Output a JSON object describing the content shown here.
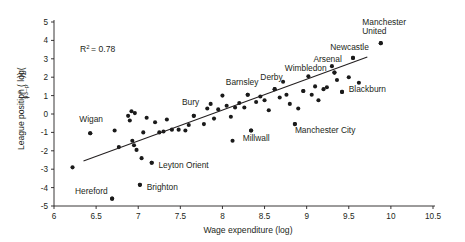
{
  "chart_data": {
    "type": "scatter",
    "title": "",
    "xlabel": "Wage expenditure (log)",
    "ylabel": "League position ( log(p/(93-p)) )",
    "ylabel_parts": {
      "prefix": "League position ( log(",
      "numerator": "p",
      "denominator": "93–p",
      "suffix": "))"
    },
    "annotation": "R² = 0.78",
    "annotation_parts": {
      "base": "R",
      "exponent": "2",
      "rest": "= 0.78"
    },
    "xlim": [
      6,
      10.5
    ],
    "ylim": [
      -5,
      5
    ],
    "xticks": [
      6,
      6.5,
      7,
      7.5,
      8,
      8.5,
      9,
      9.5,
      10,
      10.5
    ],
    "xticklabels": [
      "6",
      "6.5",
      "7",
      "7.5",
      "8",
      "8.5",
      "9",
      "9.5",
      "10",
      "10.5"
    ],
    "yticks": [
      -5,
      -4,
      -3,
      -2,
      -1,
      0,
      1,
      2,
      3,
      4,
      5
    ],
    "yticklabels": [
      "-5",
      "-4",
      "-3",
      "-2",
      "-1",
      "0",
      "1",
      "2",
      "3",
      "4",
      "5"
    ],
    "grid": false,
    "legend": null,
    "marker_color": "#1a1a1a",
    "line_color": "#231f20",
    "trendline": {
      "x0": 6.35,
      "y0": -2.55,
      "x1": 9.72,
      "y1": 3.1
    },
    "points": [
      {
        "x": 6.22,
        "y": -2.9
      },
      {
        "x": 6.43,
        "y": -1.05
      },
      {
        "x": 6.69,
        "y": -4.6
      },
      {
        "x": 6.72,
        "y": -0.9
      },
      {
        "x": 6.77,
        "y": -1.8
      },
      {
        "x": 6.88,
        "y": -0.1
      },
      {
        "x": 6.9,
        "y": -0.35
      },
      {
        "x": 6.92,
        "y": 0.15
      },
      {
        "x": 6.93,
        "y": -1.45
      },
      {
        "x": 6.95,
        "y": -1.7
      },
      {
        "x": 6.96,
        "y": 0.05
      },
      {
        "x": 6.98,
        "y": -1.95
      },
      {
        "x": 7.02,
        "y": -3.85
      },
      {
        "x": 7.04,
        "y": -2.4
      },
      {
        "x": 7.06,
        "y": -1.0
      },
      {
        "x": 7.1,
        "y": -0.2
      },
      {
        "x": 7.16,
        "y": -2.65
      },
      {
        "x": 7.2,
        "y": -0.45
      },
      {
        "x": 7.25,
        "y": -1.0
      },
      {
        "x": 7.3,
        "y": -0.95
      },
      {
        "x": 7.34,
        "y": -0.3
      },
      {
        "x": 7.4,
        "y": -0.85
      },
      {
        "x": 7.48,
        "y": -0.85
      },
      {
        "x": 7.56,
        "y": -0.9
      },
      {
        "x": 7.6,
        "y": -0.6
      },
      {
        "x": 7.66,
        "y": -0.1
      },
      {
        "x": 7.78,
        "y": -0.55
      },
      {
        "x": 7.82,
        "y": 0.3
      },
      {
        "x": 7.86,
        "y": 0.55
      },
      {
        "x": 7.9,
        "y": -0.25
      },
      {
        "x": 7.95,
        "y": 0.25
      },
      {
        "x": 8.0,
        "y": 1.0
      },
      {
        "x": 8.05,
        "y": 0.45
      },
      {
        "x": 8.1,
        "y": -0.15
      },
      {
        "x": 8.15,
        "y": 0.35
      },
      {
        "x": 8.2,
        "y": 0.6
      },
      {
        "x": 8.26,
        "y": 0.35
      },
      {
        "x": 8.3,
        "y": 1.05
      },
      {
        "x": 8.34,
        "y": -0.9
      },
      {
        "x": 8.4,
        "y": 0.65
      },
      {
        "x": 8.45,
        "y": 0.95
      },
      {
        "x": 8.5,
        "y": 0.75
      },
      {
        "x": 8.55,
        "y": 0.2
      },
      {
        "x": 8.62,
        "y": 1.35
      },
      {
        "x": 8.68,
        "y": 0.9
      },
      {
        "x": 8.72,
        "y": 1.75
      },
      {
        "x": 8.76,
        "y": 1.05
      },
      {
        "x": 8.8,
        "y": 0.55
      },
      {
        "x": 8.86,
        "y": -0.55
      },
      {
        "x": 8.9,
        "y": 0.3
      },
      {
        "x": 8.96,
        "y": 1.25
      },
      {
        "x": 9.02,
        "y": 2.05
      },
      {
        "x": 9.06,
        "y": 1.05
      },
      {
        "x": 9.1,
        "y": 1.5
      },
      {
        "x": 9.14,
        "y": 0.75
      },
      {
        "x": 9.2,
        "y": 1.35
      },
      {
        "x": 9.24,
        "y": 1.45
      },
      {
        "x": 9.3,
        "y": 2.6
      },
      {
        "x": 9.33,
        "y": 2.25
      },
      {
        "x": 9.36,
        "y": 1.85
      },
      {
        "x": 9.42,
        "y": 1.2
      },
      {
        "x": 9.5,
        "y": 2.0
      },
      {
        "x": 9.55,
        "y": 3.05
      },
      {
        "x": 9.62,
        "y": 1.7
      },
      {
        "x": 9.88,
        "y": 3.85
      },
      {
        "x": 8.12,
        "y": -1.45
      }
    ],
    "labelled_points": [
      {
        "name": "Hereford",
        "label": "Hereford",
        "x": 6.69,
        "y": -4.6,
        "label_x": 6.25,
        "label_y": -4.35,
        "anchor": "start"
      },
      {
        "name": "Wigan",
        "label": "Wigan",
        "x": 6.43,
        "y": -1.05,
        "label_x": 6.3,
        "label_y": -0.45,
        "anchor": "start"
      },
      {
        "name": "Brighton",
        "label": "Brighton",
        "x": 7.02,
        "y": -3.85,
        "label_x": 7.1,
        "label_y": -4.15,
        "anchor": "start"
      },
      {
        "name": "Leyton Orient",
        "label": "Leyton Orient",
        "x": 7.16,
        "y": -2.65,
        "label_x": 7.24,
        "label_y": -2.95,
        "anchor": "start"
      },
      {
        "name": "Bury",
        "label": "Bury",
        "x": 7.66,
        "y": -0.1,
        "label_x": 7.52,
        "label_y": 0.5,
        "anchor": "start"
      },
      {
        "name": "Barnsley",
        "label": "Barnsley",
        "x": 8.3,
        "y": 1.05,
        "label_x": 8.04,
        "label_y": 1.55,
        "anchor": "start"
      },
      {
        "name": "Derby",
        "label": "Derby",
        "x": 8.62,
        "y": 1.35,
        "label_x": 8.45,
        "label_y": 1.85,
        "anchor": "start"
      },
      {
        "name": "Millwall",
        "label": "Millwall",
        "x": 8.34,
        "y": -0.9,
        "label_x": 8.24,
        "label_y": -1.45,
        "anchor": "start"
      },
      {
        "name": "Wimbledon",
        "label": "Wimbledon",
        "x": 8.96,
        "y": 1.25,
        "label_x": 8.74,
        "label_y": 2.35,
        "anchor": "start"
      },
      {
        "name": "Manchester City",
        "label": "Manchester City",
        "x": 8.86,
        "y": -0.55,
        "label_x": 8.86,
        "label_y": -1.05,
        "anchor": "start"
      },
      {
        "name": "Arsenal",
        "label": "Arsenal",
        "x": 9.33,
        "y": 2.25,
        "label_x": 9.08,
        "label_y": 2.85,
        "anchor": "start"
      },
      {
        "name": "Blackburn",
        "label": "Blackburn",
        "x": 9.42,
        "y": 1.2,
        "label_x": 9.5,
        "label_y": 1.2,
        "anchor": "start"
      },
      {
        "name": "Newcastle",
        "label": "Newcastle",
        "x": 9.55,
        "y": 3.05,
        "label_x": 9.28,
        "label_y": 3.5,
        "anchor": "start"
      },
      {
        "name": "Manchester United",
        "label": "Manchester United",
        "x": 9.88,
        "y": 3.85,
        "label_line1": "Manchester",
        "label_line2": "United",
        "label_x": 9.66,
        "label_y": 4.85,
        "anchor": "start"
      }
    ]
  }
}
